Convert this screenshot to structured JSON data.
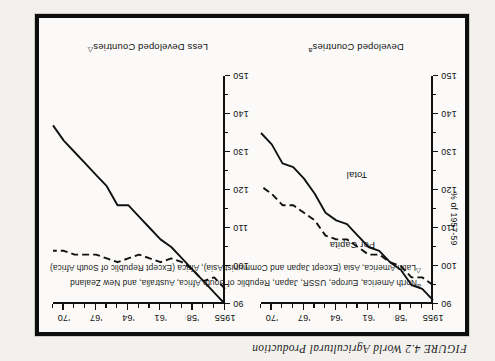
{
  "caption": "FIGURE 4.2 World Agricultural Production",
  "footnotes": [
    {
      "mark": "a",
      "text": "North America, Europe, USSR, Japan, Republic of South Africa, Australia, and New Zealand"
    },
    {
      "mark": "△",
      "text": "Latin America, Asia (Except Japan and Communist Asia), Africa (Except Republic of South Africa)"
    }
  ],
  "axis": {
    "y_title": "% of 1957-59",
    "y_ticks": [
      "90",
      "100",
      "110",
      "120",
      "130",
      "140",
      "150"
    ],
    "x_ticks": [
      "1955",
      "'58",
      "'61",
      "'64",
      "'67",
      "'70"
    ]
  },
  "panels": [
    {
      "title": "Developed Countries",
      "mark": "a"
    },
    {
      "title": "Less Developed Countries",
      "mark": "△"
    }
  ],
  "series_labels": {
    "total": "Total",
    "per_capita": "Per Capita"
  },
  "colors": {
    "ink": "#111111",
    "frame": "#0d0d0d",
    "paper": "#fbfaf8",
    "page": "#f3f1ee"
  },
  "chart_data": {
    "type": "line",
    "title": "FIGURE 4.2 World Agricultural Production",
    "xlabel": "",
    "ylabel": "% of 1957-59",
    "xlim": [
      1955,
      1971
    ],
    "ylim": [
      90,
      150
    ],
    "y_inverted": false,
    "grid": false,
    "legend": "inline-labels",
    "x": [
      1955,
      1956,
      1957,
      1958,
      1959,
      1960,
      1961,
      1962,
      1963,
      1964,
      1965,
      1966,
      1967,
      1968,
      1969,
      1970,
      1971
    ],
    "panels": [
      {
        "name": "Developed Countries",
        "footnote_mark": "a",
        "series": [
          {
            "name": "Total",
            "style": "solid",
            "values": [
              91,
              94,
              95,
              99,
              101,
              104,
              105,
              108,
              111,
              112,
              114,
              119,
              123,
              126,
              127,
              132,
              135
            ]
          },
          {
            "name": "Per Capita",
            "style": "dashed",
            "values": [
              95,
              97,
              97,
              100,
              101,
              103,
              103,
              105,
              107,
              107,
              108,
              112,
              114,
              116,
              116,
              119,
              121
            ]
          }
        ]
      },
      {
        "name": "Less Developed Countries",
        "footnote_mark": "△",
        "series": [
          {
            "name": "Total",
            "style": "solid",
            "values": [
              90,
              93,
              96,
              99,
              102,
              105,
              107,
              110,
              113,
              116,
              116,
              121,
              124,
              127,
              130,
              133,
              137
            ]
          },
          {
            "name": "Per Capita",
            "style": "dashed",
            "values": [
              94,
              97,
              96,
              99,
              101,
              102,
              101,
              102,
              103,
              102,
              101,
              102,
              103,
              103,
              103,
              104,
              104
            ]
          }
        ]
      }
    ]
  }
}
